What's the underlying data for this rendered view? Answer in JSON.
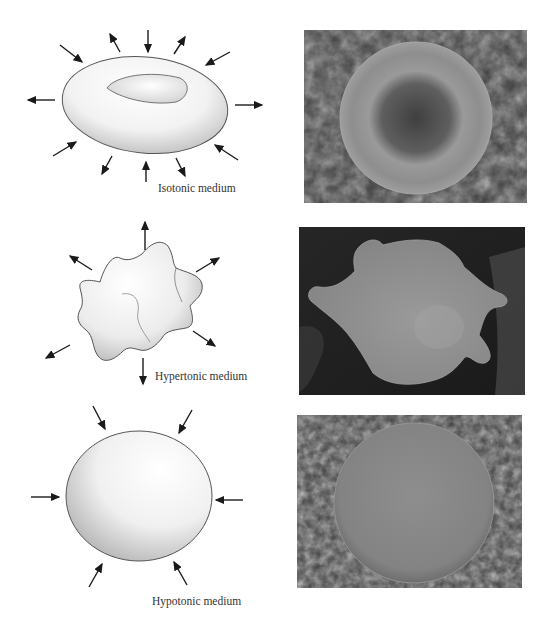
{
  "figure": {
    "rows": [
      {
        "id": "isotonic",
        "caption": "Isotonic medium",
        "cell_shape": "biconcave-disc",
        "arrows": "in-and-out (balanced)",
        "micrograph": "normal red blood cell on textured background"
      },
      {
        "id": "hypertonic",
        "caption": "Hypertonic medium",
        "cell_shape": "crenated (shrunken, spiky)",
        "arrows": "outward",
        "micrograph": "crenated red blood cell with spiky projections"
      },
      {
        "id": "hypotonic",
        "caption": "Hypotonic medium",
        "cell_shape": "swollen sphere",
        "arrows": "inward",
        "micrograph": "swollen spherical red blood cell"
      }
    ]
  },
  "colors": {
    "background": "#ffffff",
    "arrow": "#1a1a1a",
    "cell_outline": "#555555",
    "photo_dark": "#2a2a2a",
    "photo_cell": "#8a8a8a"
  }
}
